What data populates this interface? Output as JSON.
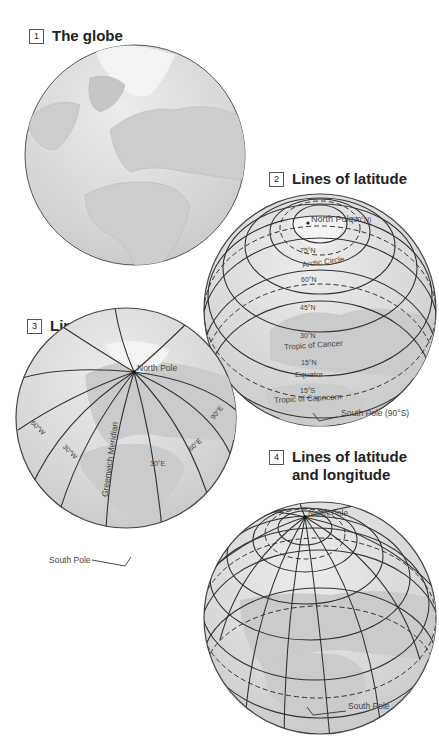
{
  "panels": [
    {
      "number": "1",
      "title": "The globe"
    },
    {
      "number": "2",
      "title": "Lines of latitude",
      "labels": {
        "north_pole": "North Pole",
        "north_pole_deg": "(90°N)",
        "lat75": "75°N",
        "arctic": "Arctic Circle",
        "lat60": "60°N",
        "lat45": "45°N",
        "lat30": "30°N",
        "cancer": "Tropic of Cancer",
        "lat15n": "15°N",
        "equator": "Equator",
        "lat15s": "15°S",
        "capricorn": "Tropic of Capricorn",
        "south_pole": "South Pole (90°S)"
      }
    },
    {
      "number": "3",
      "title": "Lines of longitude",
      "labels": {
        "north_pole": "North Pole",
        "w60": "60°W",
        "w30": "30°W",
        "meridian": "Greenwich Meridian",
        "e30": "30°E",
        "e60": "60°E",
        "e90": "90°E",
        "south_pole": "South Pole"
      }
    },
    {
      "number": "4",
      "title_line1": "Lines of latitude",
      "title_line2": "and longitude",
      "labels": {
        "north_pole": "North Pole",
        "south_pole": "South Pole"
      }
    }
  ],
  "colors": {
    "globe_fill": "#d8d8d8",
    "land_fill": "#c9c9c9",
    "ice_fill": "#f2f2f2",
    "line": "#333333"
  }
}
